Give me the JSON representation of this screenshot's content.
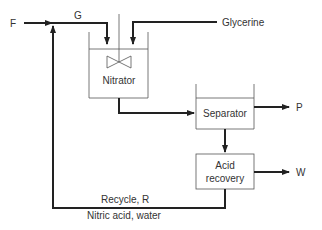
{
  "diagram": {
    "streams": {
      "feed": "F",
      "combined_feed": "G",
      "glycerine": "Glycerine",
      "product": "P",
      "waste": "W",
      "recycle": "Recycle, R",
      "recycle_desc": "Nitric acid, water"
    },
    "units": {
      "nitrator": "Nitrator",
      "separator": "Separator",
      "acid_recovery_line1": "Acid",
      "acid_recovery_line2": "recovery"
    }
  }
}
